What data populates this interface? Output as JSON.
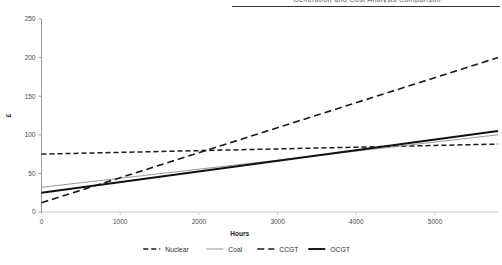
{
  "header": {
    "cutoff_text": "Generation and Cost Analysis Comparison"
  },
  "chart_data": {
    "type": "line",
    "title": "",
    "xlabel": "Hours",
    "ylabel": "£",
    "xlim": [
      0,
      5800
    ],
    "ylim": [
      0,
      250
    ],
    "xticks": [
      0,
      1000,
      2000,
      3000,
      4000,
      5000
    ],
    "xticklabels": [
      "0",
      "1000",
      "2000",
      "3000",
      "4000",
      "5000"
    ],
    "yticks": [
      0,
      50,
      100,
      150,
      200,
      250
    ],
    "yticklabels": [
      "0",
      "50",
      "100",
      "150",
      "200",
      "250"
    ],
    "grid": false,
    "legend_position": "bottom",
    "x": [
      0,
      5800
    ],
    "series": [
      {
        "name": "Nuclear",
        "style": "dashed",
        "color": "#1a1a1a",
        "width": 1.5,
        "dash": "5,3",
        "values": [
          75,
          88
        ]
      },
      {
        "name": "Coal",
        "style": "solid-thin",
        "color": "#8d8d8d",
        "width": 0.9,
        "dash": "none",
        "values": [
          32,
          100
        ]
      },
      {
        "name": "CCGT",
        "style": "dashed",
        "color": "#1a1a1a",
        "width": 1.6,
        "dash": "7,4",
        "values": [
          12,
          200
        ]
      },
      {
        "name": "OCGT",
        "style": "solid-thick",
        "color": "#111111",
        "width": 1.9,
        "dash": "none",
        "values": [
          25,
          105
        ]
      }
    ]
  },
  "legend": {
    "items": [
      {
        "label": "Nuclear"
      },
      {
        "label": "Coal"
      },
      {
        "label": "CCGT"
      },
      {
        "label": "OCGT"
      }
    ]
  }
}
